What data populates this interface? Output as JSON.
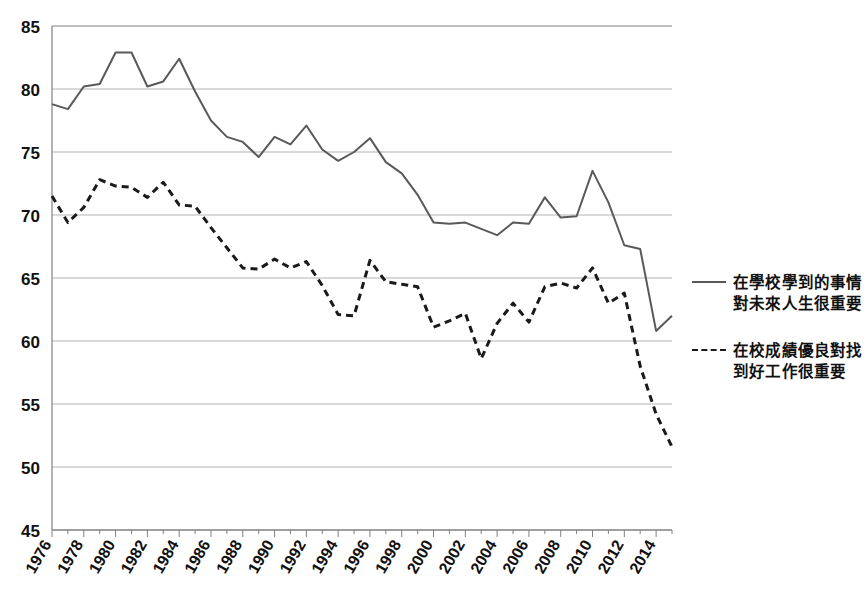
{
  "chart_data": {
    "type": "line",
    "title": "",
    "xlabel": "",
    "ylabel": "",
    "xlim": [
      1976,
      2015
    ],
    "ylim": [
      45,
      85
    ],
    "ytick_step": 5,
    "yticks": [
      45,
      50,
      55,
      60,
      65,
      70,
      75,
      80,
      85
    ],
    "xticks": [
      1976,
      1978,
      1980,
      1982,
      1984,
      1986,
      1988,
      1990,
      1992,
      1994,
      1996,
      1998,
      2000,
      2002,
      2004,
      2006,
      2008,
      2010,
      2012,
      2014
    ],
    "x": [
      1976,
      1977,
      1978,
      1979,
      1980,
      1981,
      1982,
      1983,
      1984,
      1985,
      1986,
      1987,
      1988,
      1989,
      1990,
      1991,
      1992,
      1993,
      1994,
      1995,
      1996,
      1997,
      1998,
      1999,
      2000,
      2001,
      2002,
      2003,
      2004,
      2005,
      2006,
      2007,
      2008,
      2009,
      2010,
      2011,
      2012,
      2013,
      2014,
      2015
    ],
    "grid": true,
    "grid_axis": "y",
    "legend_position": "right",
    "series": [
      {
        "name": "在學校學到的事情對未來人生很重要",
        "style": "solid",
        "color": "#595959",
        "values": [
          78.8,
          78.4,
          80.2,
          80.4,
          82.9,
          82.9,
          80.2,
          80.6,
          82.4,
          79.8,
          77.5,
          76.2,
          75.8,
          74.6,
          76.2,
          75.6,
          77.1,
          75.2,
          74.3,
          75.0,
          76.1,
          74.2,
          73.3,
          71.6,
          69.4,
          69.3,
          69.4,
          68.9,
          68.4,
          69.4,
          69.3,
          71.4,
          69.8,
          69.9,
          73.5,
          71.0,
          67.6,
          67.3,
          60.8,
          62.0
        ]
      },
      {
        "name": "在校成績優良對找到好工作很重要",
        "style": "dashed",
        "color": "#1a1a1a",
        "values": [
          71.5,
          69.4,
          70.6,
          72.8,
          72.3,
          72.2,
          71.4,
          72.6,
          70.8,
          70.7,
          69.0,
          67.4,
          65.8,
          65.7,
          66.5,
          65.8,
          66.3,
          64.4,
          62.1,
          62.0,
          66.4,
          64.7,
          64.5,
          64.3,
          61.1,
          61.6,
          62.2,
          58.6,
          61.4,
          63.0,
          61.5,
          64.3,
          64.6,
          64.2,
          65.8,
          63.0,
          63.8,
          58.0,
          54.2,
          51.6
        ]
      }
    ]
  },
  "legend": {
    "items": [
      {
        "label_line1": "在學校學到的事情",
        "label_line2": "對未來人生很重要",
        "style": "solid"
      },
      {
        "label_line1": "在校成績優良對找",
        "label_line2": "到好工作很重要",
        "style": "dashed"
      }
    ]
  },
  "colors": {
    "solid_line": "#595959",
    "dashed_line": "#1a1a1a",
    "gridline": "#b3b3b3",
    "axis": "#808080",
    "tick_label": "#111111"
  }
}
